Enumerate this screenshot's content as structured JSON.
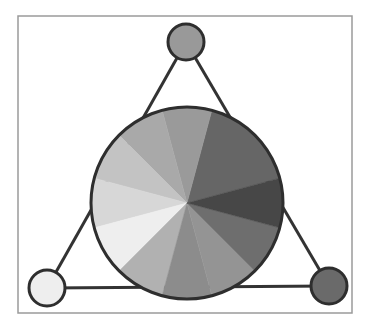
{
  "diagram": {
    "type": "color-wheel-triad",
    "frame": {
      "x": 18,
      "y": 16,
      "width": 334,
      "height": 297,
      "stroke": "#9a9a9a"
    },
    "wheel": {
      "cx": 187,
      "cy": 203,
      "r": 96,
      "stroke": "#2e2e2e",
      "slices": [
        {
          "start": 15,
          "end": 75,
          "color": "#666666"
        },
        {
          "start": 75,
          "end": 105,
          "color": "#9a9a9a"
        },
        {
          "start": 105,
          "end": 135,
          "color": "#a9a9a9"
        },
        {
          "start": 135,
          "end": 165,
          "color": "#c3c3c3"
        },
        {
          "start": 165,
          "end": 195,
          "color": "#d7d7d7"
        },
        {
          "start": 195,
          "end": 225,
          "color": "#eeeeee"
        },
        {
          "start": 225,
          "end": 255,
          "color": "#b1b1b1"
        },
        {
          "start": 255,
          "end": 285,
          "color": "#8c8c8c"
        },
        {
          "start": 285,
          "end": 315,
          "color": "#949494"
        },
        {
          "start": 315,
          "end": 345,
          "color": "#6e6e6e"
        },
        {
          "start": 345,
          "end": 375,
          "color": "#474747"
        }
      ]
    },
    "triangle": {
      "stroke": "#333333",
      "width": 3
    },
    "nodes": [
      {
        "name": "top-node",
        "cx": 186,
        "cy": 42,
        "r": 18,
        "color": "#999999"
      },
      {
        "name": "bottom-left-node",
        "cx": 47,
        "cy": 288,
        "r": 18,
        "color": "#eeeeee"
      },
      {
        "name": "bottom-right-node",
        "cx": 329,
        "cy": 286,
        "r": 18,
        "color": "#6a6a6a"
      }
    ]
  }
}
